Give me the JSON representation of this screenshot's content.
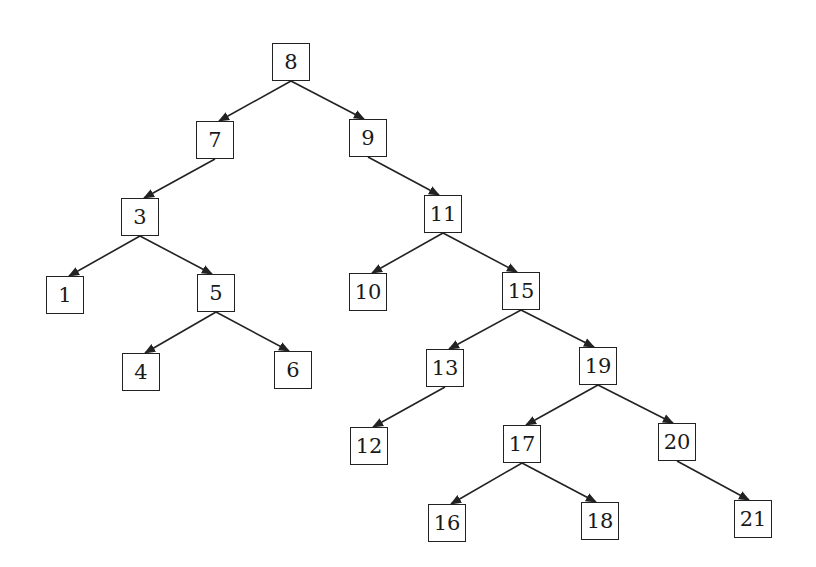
{
  "diagram": {
    "type": "binary-search-tree",
    "nodes": [
      {
        "id": "8",
        "label": "8",
        "x": 291,
        "y": 62
      },
      {
        "id": "7",
        "label": "7",
        "x": 215,
        "y": 140
      },
      {
        "id": "9",
        "label": "9",
        "x": 368,
        "y": 138
      },
      {
        "id": "3",
        "label": "3",
        "x": 140,
        "y": 217
      },
      {
        "id": "11",
        "label": "11",
        "x": 443,
        "y": 214
      },
      {
        "id": "1",
        "label": "1",
        "x": 65,
        "y": 295
      },
      {
        "id": "5",
        "label": "5",
        "x": 216,
        "y": 293
      },
      {
        "id": "10",
        "label": "10",
        "x": 368,
        "y": 292
      },
      {
        "id": "15",
        "label": "15",
        "x": 521,
        "y": 291
      },
      {
        "id": "4",
        "label": "4",
        "x": 141,
        "y": 372
      },
      {
        "id": "6",
        "label": "6",
        "x": 293,
        "y": 370
      },
      {
        "id": "13",
        "label": "13",
        "x": 445,
        "y": 368
      },
      {
        "id": "19",
        "label": "19",
        "x": 598,
        "y": 366
      },
      {
        "id": "12",
        "label": "12",
        "x": 369,
        "y": 446
      },
      {
        "id": "17",
        "label": "17",
        "x": 522,
        "y": 444
      },
      {
        "id": "20",
        "label": "20",
        "x": 677,
        "y": 442
      },
      {
        "id": "16",
        "label": "16",
        "x": 447,
        "y": 523
      },
      {
        "id": "18",
        "label": "18",
        "x": 600,
        "y": 521
      },
      {
        "id": "21",
        "label": "21",
        "x": 753,
        "y": 519
      }
    ],
    "edges": [
      [
        "8",
        "7"
      ],
      [
        "8",
        "9"
      ],
      [
        "7",
        "3"
      ],
      [
        "9",
        "11"
      ],
      [
        "3",
        "1"
      ],
      [
        "3",
        "5"
      ],
      [
        "5",
        "4"
      ],
      [
        "5",
        "6"
      ],
      [
        "11",
        "10"
      ],
      [
        "11",
        "15"
      ],
      [
        "15",
        "13"
      ],
      [
        "15",
        "19"
      ],
      [
        "13",
        "12"
      ],
      [
        "19",
        "17"
      ],
      [
        "19",
        "20"
      ],
      [
        "17",
        "16"
      ],
      [
        "17",
        "18"
      ],
      [
        "20",
        "21"
      ]
    ],
    "colors": {
      "line": "#222222",
      "box": "#222222",
      "background": "#ffffff"
    }
  }
}
